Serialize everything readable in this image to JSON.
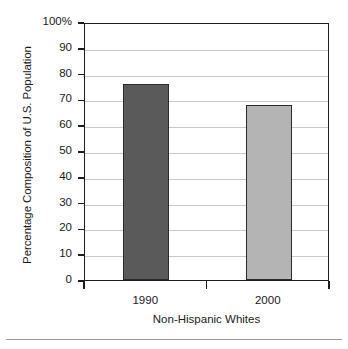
{
  "chart_data": {
    "type": "bar",
    "title": "",
    "subtitle": "",
    "xlabel": "Non-Hispanic Whites",
    "ylabel": "Percentage Composition of U.S. Population",
    "categories": [
      "1990",
      "2000"
    ],
    "values": [
      76,
      68
    ],
    "series": [
      {
        "name": "Non-Hispanic Whites",
        "values": [
          76,
          68
        ],
        "colors": [
          "#5a5a5a",
          "#b4b4b4"
        ]
      }
    ],
    "ylim": [
      0,
      100
    ],
    "ytick_values": [
      0,
      10,
      20,
      30,
      40,
      50,
      60,
      70,
      80,
      90,
      100
    ],
    "ytick_labels": [
      "0",
      "10",
      "20",
      "30",
      "40",
      "50",
      "60",
      "70",
      "80",
      "90",
      "100%"
    ],
    "grid": true,
    "grid_axis": "y",
    "legend": false,
    "legend_position": "none",
    "annotations": [],
    "colors": {
      "bar_1990": "#5a5a5a",
      "bar_2000": "#b4b4b4",
      "axis": "#1c1c1c",
      "gridline": "#c8c8c8",
      "text": "#1a1a1a",
      "background": "#ffffff"
    }
  }
}
